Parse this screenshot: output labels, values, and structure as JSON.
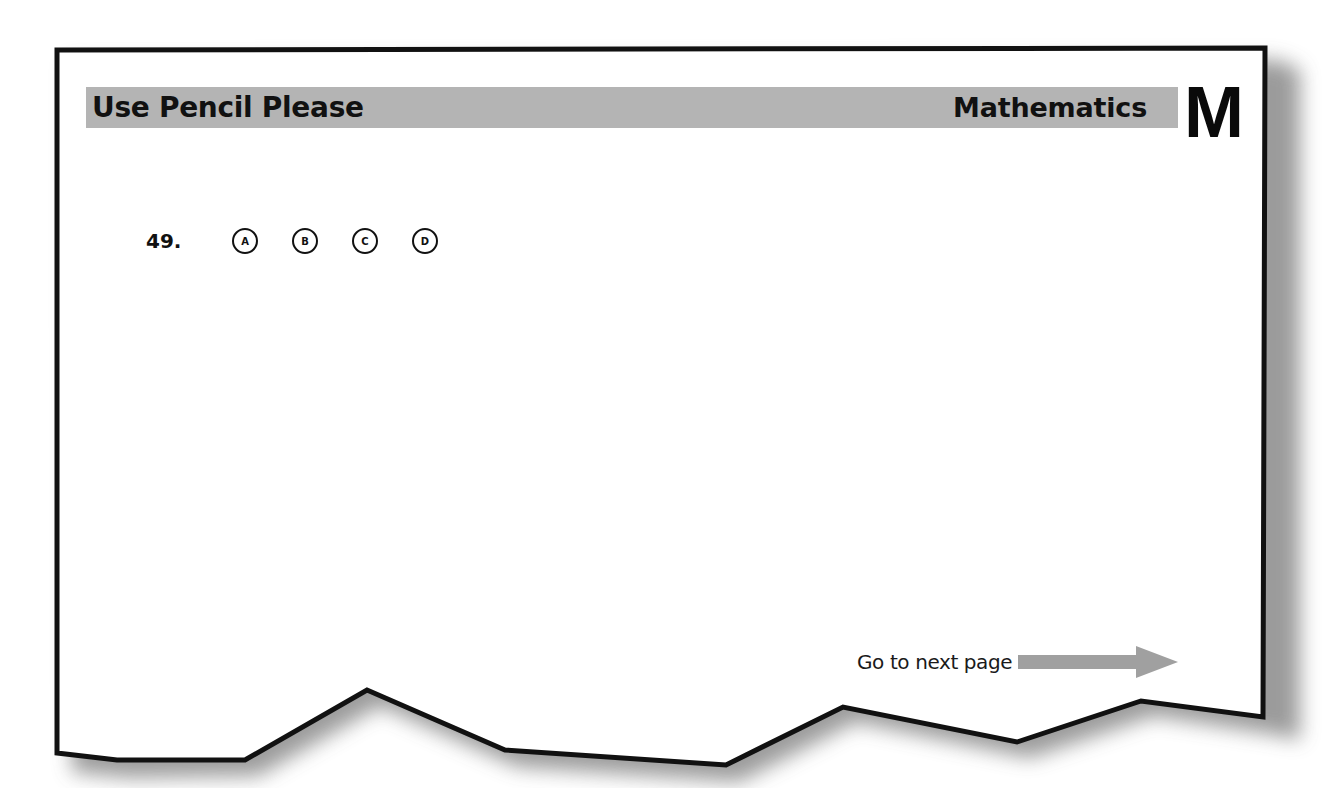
{
  "header": {
    "title": "Use Pencil Please",
    "subject": "Mathematics",
    "section_letter": "M"
  },
  "question": {
    "number": "49.",
    "options": [
      "A",
      "B",
      "C",
      "D"
    ]
  },
  "footer": {
    "next_page_label": "Go to next page",
    "arrow_icon": "right-arrow-icon"
  },
  "colors": {
    "header_band": "#b4b4b4",
    "border": "#111111",
    "arrow": "#a0a0a0",
    "shadow": "#8a8a8a"
  }
}
